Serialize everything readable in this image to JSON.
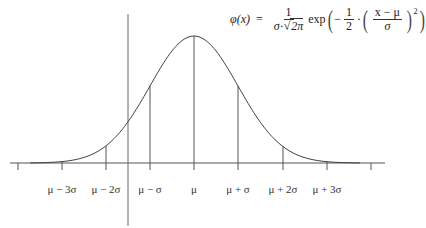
{
  "diagram": {
    "formula": {
      "lhs": "φ(x)",
      "equals": "=",
      "coef_num": "1",
      "coef_den_sigma": "σ",
      "coef_den_dot": "·",
      "coef_den_sqrt": "√",
      "coef_den_rad": "2π",
      "exp": "exp",
      "minus": "−",
      "half_num": "1",
      "half_den": "2",
      "dot": "·",
      "inner_num": "x − μ",
      "inner_den": "σ",
      "power": "2"
    },
    "axis_labels": [
      {
        "label": "μ − 3σ",
        "x": 62
      },
      {
        "label": "μ − 2σ",
        "x": 106
      },
      {
        "label": "μ − σ",
        "x": 150
      },
      {
        "label": "μ",
        "x": 194
      },
      {
        "label": "μ + σ",
        "x": 238
      },
      {
        "label": "μ + 2σ",
        "x": 283
      },
      {
        "label": "μ + 3σ",
        "x": 327
      }
    ],
    "colors": {
      "curve": "#444444",
      "axis": "#555555",
      "text": "#333333"
    }
  }
}
